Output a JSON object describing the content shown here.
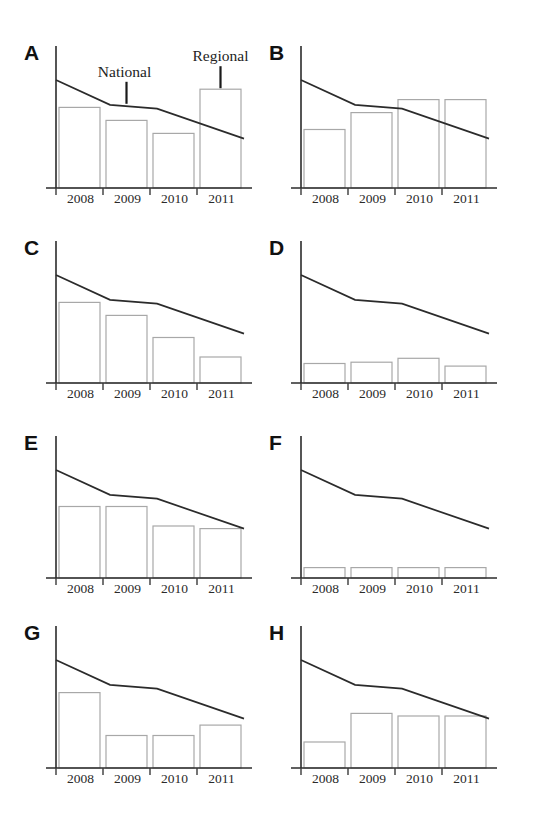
{
  "figure": {
    "title_fragment": "",
    "panel_count": 8,
    "categories": [
      "2008",
      "2009",
      "2010",
      "2011"
    ],
    "annotations": {
      "bar_series_label": "Regional",
      "line_series_label": "National"
    }
  },
  "chart_data": [
    {
      "type": "bar",
      "panel": "A",
      "title": "A",
      "xlabel": "",
      "ylabel": "",
      "categories": [
        "2008",
        "2009",
        "2010",
        "2011"
      ],
      "grid": false,
      "legend": "annotated-inline",
      "ylim": [
        0,
        100
      ],
      "series": [
        {
          "name": "Regional",
          "kind": "bar",
          "values": [
            62,
            52,
            42,
            76
          ]
        },
        {
          "name": "National",
          "kind": "line",
          "values": [
            83,
            64,
            61,
            38
          ]
        }
      ],
      "annotations": [
        {
          "text": "National",
          "points_to": "line",
          "at_category": "2009"
        },
        {
          "text": "Regional",
          "points_to": "bar",
          "at_category": "2011"
        }
      ]
    },
    {
      "type": "bar",
      "panel": "B",
      "title": "B",
      "xlabel": "",
      "ylabel": "",
      "categories": [
        "2008",
        "2009",
        "2010",
        "2011"
      ],
      "grid": false,
      "ylim": [
        0,
        100
      ],
      "series": [
        {
          "name": "Regional",
          "kind": "bar",
          "values": [
            45,
            58,
            68,
            68
          ]
        },
        {
          "name": "National",
          "kind": "line",
          "values": [
            83,
            64,
            61,
            38
          ]
        }
      ]
    },
    {
      "type": "bar",
      "panel": "C",
      "title": "C",
      "xlabel": "",
      "ylabel": "",
      "categories": [
        "2008",
        "2009",
        "2010",
        "2011"
      ],
      "grid": false,
      "ylim": [
        0,
        100
      ],
      "series": [
        {
          "name": "Regional",
          "kind": "bar",
          "values": [
            62,
            52,
            35,
            20
          ]
        },
        {
          "name": "National",
          "kind": "line",
          "values": [
            83,
            64,
            61,
            38
          ]
        }
      ]
    },
    {
      "type": "bar",
      "panel": "D",
      "title": "D",
      "xlabel": "",
      "ylabel": "",
      "categories": [
        "2008",
        "2009",
        "2010",
        "2011"
      ],
      "grid": false,
      "ylim": [
        0,
        100
      ],
      "series": [
        {
          "name": "Regional",
          "kind": "bar",
          "values": [
            15,
            16,
            19,
            13
          ]
        },
        {
          "name": "National",
          "kind": "line",
          "values": [
            83,
            64,
            61,
            38
          ]
        }
      ]
    },
    {
      "type": "bar",
      "panel": "E",
      "title": "E",
      "xlabel": "",
      "ylabel": "",
      "categories": [
        "2008",
        "2009",
        "2010",
        "2011"
      ],
      "grid": false,
      "ylim": [
        0,
        100
      ],
      "series": [
        {
          "name": "Regional",
          "kind": "bar",
          "values": [
            55,
            55,
            40,
            38
          ]
        },
        {
          "name": "National",
          "kind": "line",
          "values": [
            83,
            64,
            61,
            38
          ]
        }
      ]
    },
    {
      "type": "bar",
      "panel": "F",
      "title": "F",
      "xlabel": "",
      "ylabel": "",
      "categories": [
        "2008",
        "2009",
        "2010",
        "2011"
      ],
      "grid": false,
      "ylim": [
        0,
        100
      ],
      "series": [
        {
          "name": "Regional",
          "kind": "bar",
          "values": [
            8,
            8,
            8,
            8
          ]
        },
        {
          "name": "National",
          "kind": "line",
          "values": [
            83,
            64,
            61,
            38
          ]
        }
      ]
    },
    {
      "type": "bar",
      "panel": "G",
      "title": "G",
      "xlabel": "",
      "ylabel": "",
      "categories": [
        "2008",
        "2009",
        "2010",
        "2011"
      ],
      "grid": false,
      "ylim": [
        0,
        100
      ],
      "series": [
        {
          "name": "Regional",
          "kind": "bar",
          "values": [
            58,
            25,
            25,
            33
          ]
        },
        {
          "name": "National",
          "kind": "line",
          "values": [
            83,
            64,
            61,
            38
          ]
        }
      ]
    },
    {
      "type": "bar",
      "panel": "H",
      "title": "H",
      "xlabel": "",
      "ylabel": "",
      "categories": [
        "2008",
        "2009",
        "2010",
        "2011"
      ],
      "grid": false,
      "ylim": [
        0,
        100
      ],
      "series": [
        {
          "name": "Regional",
          "kind": "bar",
          "values": [
            20,
            42,
            40,
            40
          ]
        },
        {
          "name": "National",
          "kind": "line",
          "values": [
            83,
            64,
            61,
            38
          ]
        }
      ]
    }
  ]
}
